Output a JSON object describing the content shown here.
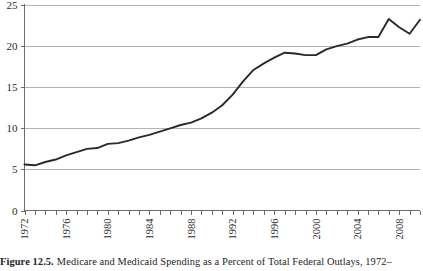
{
  "caption": {
    "figure_number": "Figure 12.5.",
    "text": "Medicare and Medicaid Spending as a Percent of Total Federal Outlays, 1972–"
  },
  "chart_data": {
    "type": "line",
    "title": "Medicare and Medicaid Spending as a Percent of Total Federal Outlays, 1972–",
    "xlabel": "",
    "ylabel": "",
    "xlim": [
      1971.5,
      1972
    ],
    "ylim": [
      0,
      25
    ],
    "grid": true,
    "legend": false,
    "y_ticks": [
      0,
      5,
      10,
      15,
      20,
      25
    ],
    "y_tick_labels": [
      "0",
      "5",
      "10",
      "15",
      "20",
      "25"
    ],
    "x_tick_labels": [
      "1972",
      "1976",
      "1980",
      "1984",
      "1988",
      "1992",
      "1996",
      "2000",
      "2004",
      "2008"
    ],
    "x_tick_label_rotation": -90,
    "x_minor_tick_interval": 1,
    "x": [
      1972,
      1973,
      1974,
      1975,
      1976,
      1977,
      1978,
      1979,
      1980,
      1981,
      1982,
      1983,
      1984,
      1985,
      1986,
      1987,
      1988,
      1989,
      1990,
      1991,
      1992,
      1993,
      1994,
      1995,
      1996,
      1997,
      1998,
      1999,
      2000,
      2001,
      2002,
      2003,
      2004,
      2005,
      2006,
      2007,
      2008,
      2009,
      2010
    ],
    "series": [
      {
        "name": "Medicare and Medicaid Spending",
        "color": "#2a2a2a",
        "values": [
          5.6,
          5.5,
          5.9,
          6.2,
          6.7,
          7.1,
          7.5,
          7.6,
          8.1,
          8.2,
          8.5,
          8.9,
          9.2,
          9.6,
          10.0,
          10.4,
          10.7,
          11.2,
          11.9,
          12.8,
          14.1,
          15.7,
          17.1,
          17.9,
          18.6,
          19.2,
          19.1,
          18.9,
          18.9,
          19.6,
          20.0,
          20.3,
          20.8,
          21.1,
          21.1,
          23.3,
          22.3,
          21.5,
          23.2
        ]
      }
    ]
  }
}
